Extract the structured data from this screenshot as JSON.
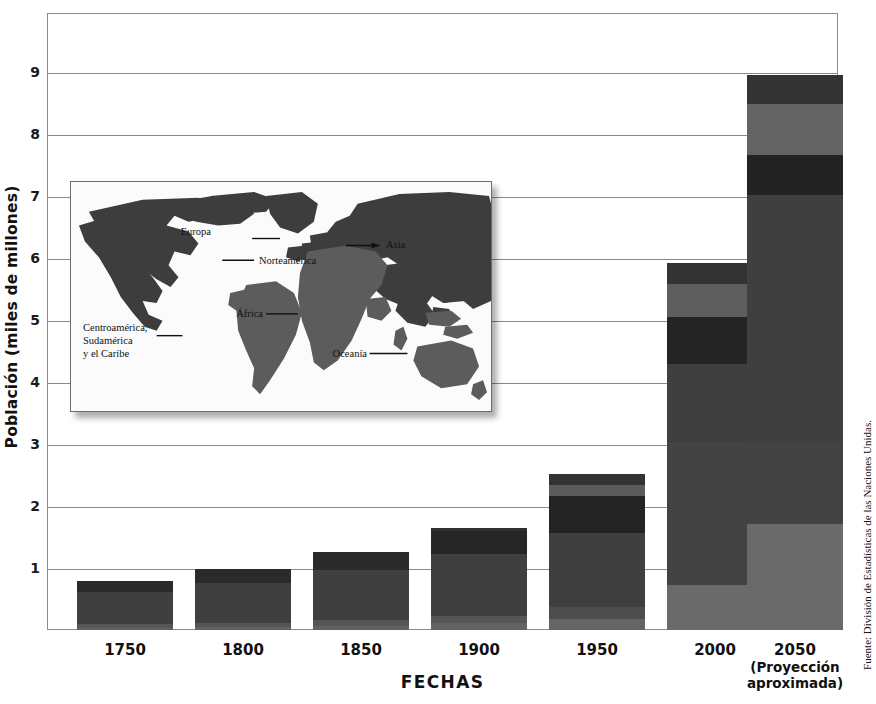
{
  "axes": {
    "ylabel": "Población (miles de millones)",
    "xlabel": "FECHAS",
    "yticks": [
      "9",
      "8",
      "7",
      "6",
      "5",
      "4",
      "3",
      "2",
      "1"
    ],
    "ytick_values": [
      9,
      8,
      7,
      6,
      5,
      4,
      3,
      2,
      1
    ],
    "ylim": [
      0,
      10
    ],
    "grid": true
  },
  "source_note": "Fuente: División de Estadísticas de las Naciones Unidas.",
  "xlabels": [
    {
      "year": "1750",
      "sub1": "",
      "sub2": ""
    },
    {
      "year": "1800",
      "sub1": "",
      "sub2": ""
    },
    {
      "year": "1850",
      "sub1": "",
      "sub2": ""
    },
    {
      "year": "1900",
      "sub1": "",
      "sub2": ""
    },
    {
      "year": "1950",
      "sub1": "",
      "sub2": ""
    },
    {
      "year": "2000",
      "sub1": "",
      "sub2": ""
    },
    {
      "year": "2050",
      "sub1": "(Proyección",
      "sub2": "aproximada)"
    }
  ],
  "colors": {
    "asia": "#3f3f3f",
    "africa": "#595959",
    "europa": "#2b2b2b",
    "latinoamerica": "#6e6e6e",
    "norteamerica": "#4a4a4a",
    "oceania": "#2f2f2f",
    "gridline": "#8a8a8a",
    "map_land_dark": "#3d3d3d",
    "map_land_mid": "#5c5c5c",
    "text": "#111111"
  },
  "map": {
    "labels": [
      {
        "name": "Europa",
        "text": "Europa"
      },
      {
        "name": "Asia",
        "text": "Asia"
      },
      {
        "name": "Norteamérica",
        "text": "Norteamérica"
      },
      {
        "name": "África",
        "text": "África"
      },
      {
        "name": "Oceanía",
        "text": "Oceanía"
      },
      {
        "name": "Centroamérica",
        "text": "Centroamérica,\nSudamérica\ny el Caribe"
      }
    ],
    "label_europa": "Europa",
    "label_asia": "Asia",
    "label_norteamerica": "Norteamérica",
    "label_africa": "África",
    "label_oceania": "Oceanía",
    "label_latam_1": "Centroamérica,",
    "label_latam_2": "Sudamérica",
    "label_latam_3": "y el Caribe"
  },
  "chart_data": {
    "type": "bar",
    "stacked": true,
    "title": "",
    "xlabel": "FECHAS",
    "ylabel": "Población (miles de millones)",
    "ylim": [
      0,
      10
    ],
    "categories": [
      "1750",
      "1800",
      "1850",
      "1900",
      "1950",
      "2000",
      "2050"
    ],
    "totals": [
      0.79,
      0.98,
      1.26,
      1.65,
      2.52,
      5.92,
      8.95
    ],
    "series": [
      {
        "name": "Centroamérica, Sudamérica y el Caribe",
        "color": "#6e6e6e",
        "values": [
          0.02,
          0.03,
          0.04,
          0.08,
          0.17,
          0.73,
          1.71
        ]
      },
      {
        "name": "Norteamérica",
        "color": "#4a4a4a",
        "values": [
          0.02,
          0.02,
          0.03,
          0.09,
          0.17,
          0.32,
          0.45
        ]
      },
      {
        "name": "Asia",
        "color": "#3f3f3f",
        "values": [
          0.5,
          0.63,
          0.81,
          0.95,
          1.4,
          3.68,
          5.25
        ]
      },
      {
        "name": "Europa",
        "color": "#2b2b2b",
        "values": [
          0.17,
          0.2,
          0.27,
          0.41,
          0.55,
          0.73,
          0.63
        ]
      },
      {
        "name": "África",
        "color": "#595959",
        "values": [
          0.07,
          0.09,
          0.1,
          0.11,
          0.22,
          0.39,
          0.81
        ]
      },
      {
        "name": "Oceanía",
        "color": "#2f2f2f",
        "values": [
          0.01,
          0.01,
          0.01,
          0.01,
          0.01,
          0.07,
          0.1
        ]
      }
    ]
  },
  "bars": [
    {
      "year": "1750",
      "total": 0.79,
      "left": 30,
      "width": 96,
      "segments": [
        {
          "name": "europa",
          "top": 0.79,
          "bottom": 0.62,
          "color": "#2a2a2a"
        },
        {
          "name": "asia",
          "top": 0.62,
          "bottom": 0.1,
          "color": "#3f3f3f"
        },
        {
          "name": "africa",
          "top": 0.1,
          "bottom": 0.04,
          "color": "#565656"
        },
        {
          "name": "latinoamerica",
          "top": 0.04,
          "bottom": 0.0,
          "color": "#616161"
        }
      ]
    },
    {
      "year": "1800",
      "total": 0.98,
      "left": 148,
      "width": 96,
      "segments": [
        {
          "name": "europa",
          "top": 0.98,
          "bottom": 0.76,
          "color": "#2a2a2a"
        },
        {
          "name": "asia",
          "top": 0.76,
          "bottom": 0.12,
          "color": "#3f3f3f"
        },
        {
          "name": "africa",
          "top": 0.12,
          "bottom": 0.05,
          "color": "#565656"
        },
        {
          "name": "latinoamerica",
          "top": 0.05,
          "bottom": 0.0,
          "color": "#616161"
        }
      ]
    },
    {
      "year": "1850",
      "total": 1.26,
      "left": 266,
      "width": 96,
      "segments": [
        {
          "name": "europa",
          "top": 1.26,
          "bottom": 0.96,
          "color": "#2a2a2a"
        },
        {
          "name": "asia",
          "top": 0.96,
          "bottom": 0.16,
          "color": "#3f3f3f"
        },
        {
          "name": "africa",
          "top": 0.16,
          "bottom": 0.06,
          "color": "#565656"
        },
        {
          "name": "latinoamerica",
          "top": 0.06,
          "bottom": 0.0,
          "color": "#616161"
        }
      ]
    },
    {
      "year": "1900",
      "total": 1.65,
      "left": 384,
      "width": 96,
      "segments": [
        {
          "name": "oceania",
          "top": 1.65,
          "bottom": 1.6,
          "color": "#303030"
        },
        {
          "name": "europa",
          "top": 1.6,
          "bottom": 1.22,
          "color": "#262626"
        },
        {
          "name": "asia",
          "top": 1.22,
          "bottom": 0.22,
          "color": "#3f3f3f"
        },
        {
          "name": "africa",
          "top": 0.22,
          "bottom": 0.11,
          "color": "#565656"
        },
        {
          "name": "latinoamerica",
          "top": 0.11,
          "bottom": 0.0,
          "color": "#636363"
        }
      ]
    },
    {
      "year": "1950",
      "total": 2.52,
      "left": 502,
      "width": 96,
      "segments": [
        {
          "name": "oceania",
          "top": 2.52,
          "bottom": 2.34,
          "color": "#333333"
        },
        {
          "name": "africa",
          "top": 2.34,
          "bottom": 2.16,
          "color": "#5b5b5b"
        },
        {
          "name": "europa",
          "top": 2.16,
          "bottom": 1.56,
          "color": "#242424"
        },
        {
          "name": "asia",
          "top": 1.56,
          "bottom": 0.37,
          "color": "#3f3f3f"
        },
        {
          "name": "norteamerica",
          "top": 0.37,
          "bottom": 0.18,
          "color": "#4d4d4d"
        },
        {
          "name": "latinoamerica",
          "top": 0.18,
          "bottom": 0.0,
          "color": "#656565"
        }
      ]
    },
    {
      "year": "2000",
      "total": 5.92,
      "left": 620,
      "width": 96,
      "segments": [
        {
          "name": "oceania",
          "top": 5.92,
          "bottom": 5.58,
          "color": "#333333"
        },
        {
          "name": "africa",
          "top": 5.58,
          "bottom": 5.05,
          "color": "#5e5e5e"
        },
        {
          "name": "europa",
          "top": 5.05,
          "bottom": 4.29,
          "color": "#242424"
        },
        {
          "name": "asia",
          "top": 4.29,
          "bottom": 3.03,
          "color": "#3f3f3f"
        },
        {
          "name": "asia2",
          "top": 3.03,
          "bottom": 0.73,
          "color": "#434343"
        },
        {
          "name": "latinoamerica",
          "top": 0.73,
          "bottom": 0.0,
          "color": "#6a6a6a"
        }
      ]
    },
    {
      "year": "2050",
      "total": 8.95,
      "left": 700,
      "width": 96,
      "segments": [
        {
          "name": "oceania",
          "top": 8.95,
          "bottom": 8.48,
          "color": "#333333"
        },
        {
          "name": "africa",
          "top": 8.48,
          "bottom": 7.66,
          "color": "#636363"
        },
        {
          "name": "europa",
          "top": 7.66,
          "bottom": 7.02,
          "color": "#232323"
        },
        {
          "name": "asia",
          "top": 7.02,
          "bottom": 3.03,
          "color": "#3f3f3f"
        },
        {
          "name": "asia2",
          "top": 3.03,
          "bottom": 1.71,
          "color": "#424242"
        },
        {
          "name": "latinoamerica",
          "top": 1.71,
          "bottom": 0.0,
          "color": "#6a6a6a"
        }
      ]
    }
  ]
}
